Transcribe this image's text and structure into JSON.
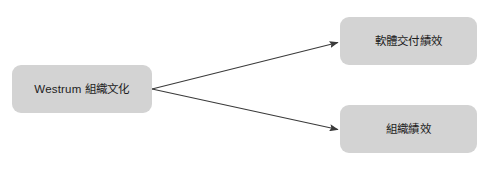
{
  "diagram": {
    "background_color": "#ffffff",
    "node_fill_color": "#d3d3d3",
    "node_text_color": "#1c1c1c",
    "connector_color": "#3a3a3a",
    "nodes": [
      {
        "id": "source",
        "label": "Westrum 組織文化",
        "role": "cause",
        "x": 12,
        "y": 65,
        "width": 140,
        "height": 48
      },
      {
        "id": "target-delivery",
        "label": "軟體交付績效",
        "role": "effect",
        "x": 340,
        "y": 17,
        "width": 137,
        "height": 48
      },
      {
        "id": "target-org",
        "label": "組織績效",
        "role": "effect",
        "x": 340,
        "y": 105,
        "width": 137,
        "height": 48
      }
    ],
    "connectors": [
      {
        "id": "arrow-source-to-delivery",
        "from": "source",
        "to": "target-delivery",
        "style": "solid-arrow",
        "x1": 152,
        "y1": 89,
        "x2": 339,
        "y2": 42
      },
      {
        "id": "arrow-source-to-org",
        "from": "source",
        "to": "target-org",
        "style": "solid-arrow",
        "x1": 152,
        "y1": 89,
        "x2": 339,
        "y2": 130
      }
    ]
  }
}
